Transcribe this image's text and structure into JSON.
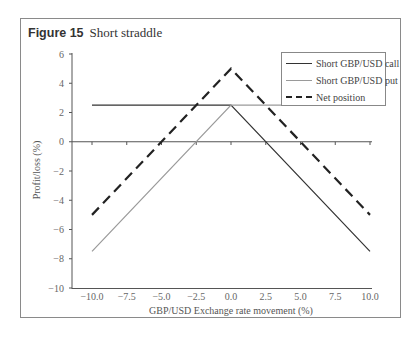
{
  "figure": {
    "number_label": "Figure 15",
    "title": "Short straddle"
  },
  "legend": {
    "items": [
      {
        "label": "Short GBP/USD call",
        "color": "#333333",
        "style": "solid"
      },
      {
        "label": "Short GBP/USD put",
        "color": "#9a9a9a",
        "style": "solid"
      },
      {
        "label": "Net position",
        "color": "#222222",
        "style": "dashed"
      }
    ]
  },
  "chart_data": {
    "type": "line",
    "xlabel": "GBP/USD Exchange rate movement (%)",
    "ylabel": "Profit/loss (%)",
    "xlim": [
      -10,
      10
    ],
    "ylim": [
      -10,
      6
    ],
    "x_ticks": [
      "-10.0",
      "-7.5",
      "-5.0",
      "-2.5",
      "0.0",
      "2.5",
      "5.0",
      "7.5",
      "10.0"
    ],
    "y_ticks": [
      "6",
      "4",
      "2",
      "0",
      "-2",
      "-4",
      "-6",
      "-8",
      "-10"
    ],
    "x": [
      -10,
      0,
      10
    ],
    "series": [
      {
        "name": "Short GBP/USD call",
        "points": [
          [
            -10,
            2.5
          ],
          [
            0,
            2.5
          ],
          [
            10,
            -7.5
          ]
        ]
      },
      {
        "name": "Short GBP/USD put",
        "points": [
          [
            -10,
            -7.5
          ],
          [
            0,
            2.5
          ],
          [
            10,
            2.5
          ]
        ]
      },
      {
        "name": "Net position",
        "points": [
          [
            -10,
            -5
          ],
          [
            0,
            5
          ],
          [
            10,
            -5
          ]
        ]
      }
    ],
    "grid": false,
    "legend_position": "upper right"
  }
}
